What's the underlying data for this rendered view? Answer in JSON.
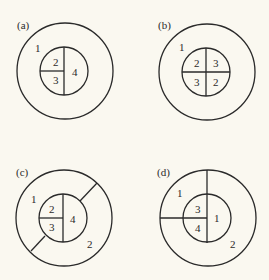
{
  "figure": {
    "stroke_color": "#2a2a2a",
    "background": "#faf8f0",
    "panels": [
      {
        "id": "a",
        "label": "(a)",
        "regions": [
          "1",
          "2",
          "3",
          "4"
        ]
      },
      {
        "id": "b",
        "label": "(b)",
        "regions": [
          "1",
          "2",
          "3",
          "3",
          "2"
        ]
      },
      {
        "id": "c",
        "label": "(c)",
        "regions": [
          "1",
          "2",
          "3",
          "4",
          "2"
        ]
      },
      {
        "id": "d",
        "label": "(d)",
        "regions": [
          "1",
          "3",
          "4",
          "1",
          "2"
        ]
      }
    ]
  }
}
